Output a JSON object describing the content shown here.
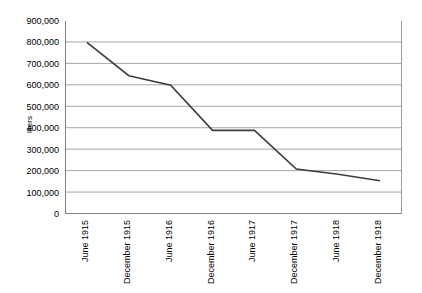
{
  "chart_data": {
    "type": "line",
    "title": "",
    "xlabel": "",
    "ylabel": "liters",
    "categories": [
      "June 1915",
      "December 1915",
      "June 1916",
      "December 1916",
      "June 1917",
      "December 1917",
      "June 1918",
      "December 1918"
    ],
    "values": [
      800000,
      645000,
      600000,
      390000,
      390000,
      210000,
      185000,
      155000
    ],
    "series": [
      {
        "name": "liters",
        "values": [
          800000,
          645000,
          600000,
          390000,
          390000,
          210000,
          185000,
          155000
        ]
      }
    ],
    "ylim": [
      0,
      900000
    ],
    "y_ticks": [
      0,
      100000,
      200000,
      300000,
      400000,
      500000,
      600000,
      700000,
      800000,
      900000
    ],
    "y_tick_labels": [
      "0",
      "100,000",
      "200,000",
      "300,000",
      "400,000",
      "500,000",
      "600,000",
      "700,000",
      "800,000",
      "900,000"
    ],
    "grid": true,
    "grid_axis": "y",
    "legend": false,
    "legend_position": "none",
    "line_color": "#3d3d3d",
    "grid_color": "#a6a6a6",
    "axis_color": "#808080",
    "background_color": "#ffffff",
    "markers": false
  }
}
